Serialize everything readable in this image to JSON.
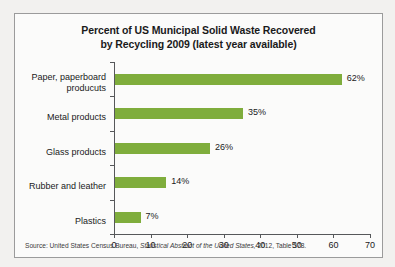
{
  "chart_data": {
    "type": "bar",
    "orientation": "horizontal",
    "title": "Percent of US Municipal Solid Waste Recovered by Recycling 2009 (latest year available)",
    "title_lines": [
      "Percent of US Municipal Solid Waste Recovered",
      "by Recycling 2009 (latest year available)"
    ],
    "categories": [
      "Paper, paperboard\nproducuts",
      "Metal products",
      "Glass products",
      "Rubber and leather",
      "Plastics"
    ],
    "values": [
      62,
      35,
      26,
      14,
      7
    ],
    "value_labels": [
      "62%",
      "35%",
      "26%",
      "14%",
      "7%"
    ],
    "xlabel": "",
    "ylabel": "",
    "xlim": [
      0,
      70
    ],
    "xticks": [
      0,
      10,
      20,
      30,
      40,
      50,
      60,
      70
    ],
    "xtick_labels": [
      "0",
      "10",
      "20",
      "30",
      "40",
      "50",
      "60",
      "70"
    ],
    "grid": false,
    "legend": false,
    "bar_color": "#7fad3c",
    "axis_color": "#56585a",
    "background": "#fbfbfa"
  },
  "source": {
    "prefix": "Source: United States Census Bureau, ",
    "italic_title": "Statistical Abstract of the United States,",
    "suffix": " 2012, Table 378."
  }
}
